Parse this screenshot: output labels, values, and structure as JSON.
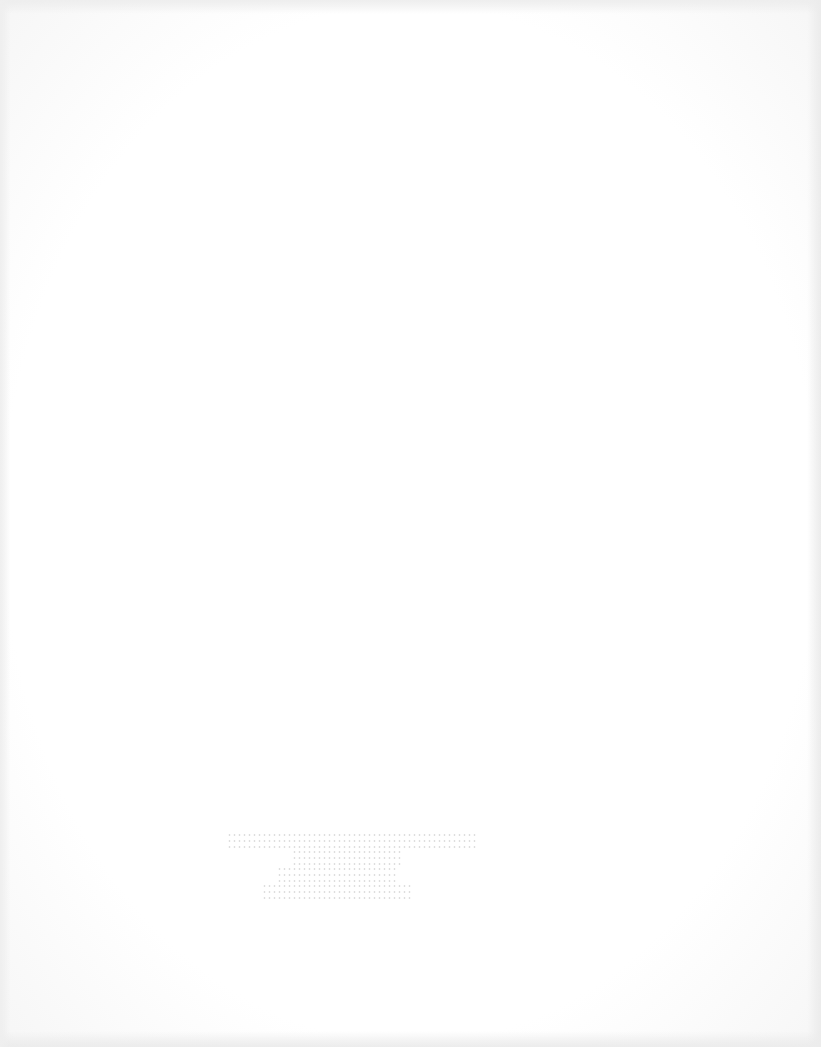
{
  "document": {
    "type": "scanned-page",
    "background_color": "#ffffff",
    "visible_text_legible": false,
    "bleed_through_block": {
      "line_count": 4,
      "lines": [
        "",
        "",
        "",
        ""
      ]
    }
  }
}
